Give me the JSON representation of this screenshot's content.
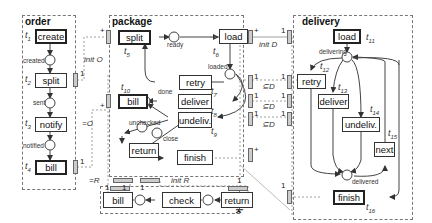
{
  "regions": {
    "order": {
      "title": "order"
    },
    "package": {
      "title": "package"
    },
    "delivery": {
      "title": "delivery"
    },
    "back": {
      "title": "back"
    }
  },
  "order": {
    "transitions": [
      {
        "label": "create",
        "id": "t",
        "sub": "1"
      },
      {
        "label": "split",
        "id": "t",
        "sub": "2"
      },
      {
        "label": "notify",
        "id": "t",
        "sub": "3"
      },
      {
        "label": "bill",
        "id": "t",
        "sub": "4"
      }
    ],
    "places": [
      "created",
      "sent",
      "notified"
    ]
  },
  "package": {
    "transitions": [
      {
        "label": "split",
        "id": "t",
        "sub": "5"
      },
      {
        "label": "load",
        "id": "t",
        "sub": "6"
      },
      {
        "label": "retry",
        "id": "t",
        "sub": "7"
      },
      {
        "label": "deliver",
        "id": "t",
        "sub": "8"
      },
      {
        "label": "undeliv.",
        "id": "t",
        "sub": "9"
      },
      {
        "label": "bill",
        "id": "t",
        "sub": "10"
      },
      {
        "label": "return",
        "id": "",
        "sub": ""
      },
      {
        "label": "finish",
        "id": "",
        "sub": ""
      }
    ],
    "places": [
      "ready",
      "loaded",
      "done",
      "unchecked",
      "close"
    ]
  },
  "delivery": {
    "transitions": [
      {
        "label": "load",
        "id": "t",
        "sub": "11"
      },
      {
        "label": "retry",
        "id": "t",
        "sub": "12"
      },
      {
        "label": "deliver",
        "id": "t",
        "sub": "13"
      },
      {
        "label": "undeliv.",
        "id": "t",
        "sub": "14"
      },
      {
        "label": "next",
        "id": "t",
        "sub": "15"
      },
      {
        "label": "finish",
        "id": "t",
        "sub": "16"
      }
    ],
    "places": [
      "delivering",
      "delivered"
    ]
  },
  "back": {
    "transitions": [
      {
        "label": "bill"
      },
      {
        "label": "check"
      },
      {
        "label": "return"
      }
    ]
  },
  "channels": {
    "init_o": "init O",
    "eq_o": "=O",
    "init_d": "init D",
    "sub_d1": "⊆D",
    "sub_d2": "⊆D",
    "sub_d3": "⊆D",
    "init_r": "init R",
    "eq_r": "=R"
  },
  "cardinalities": {
    "one": "1",
    "plus": "+"
  },
  "colors": {
    "line": "#444444",
    "port_fill": "#cccccc",
    "region_border": "#777777"
  }
}
